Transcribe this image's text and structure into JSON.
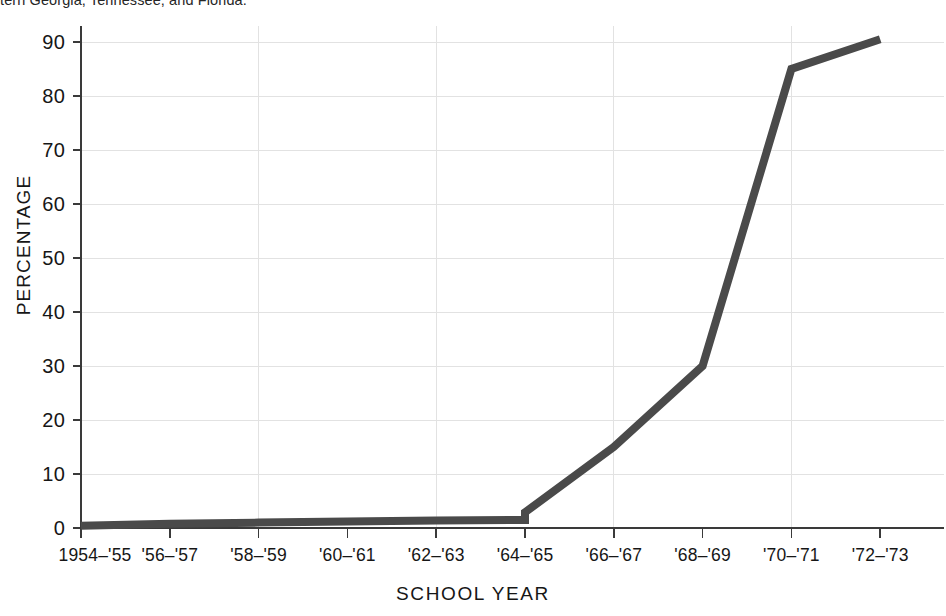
{
  "caption": {
    "text": "tern Georgia, Tennessee, and Florida."
  },
  "chart_data": {
    "type": "line",
    "title": "",
    "subtitle": "",
    "xlabel": "SCHOOL YEAR",
    "ylabel": "PERCENTAGE",
    "categories": [
      "1954–'55",
      "'56–'57",
      "'58–'59",
      "'60–'61",
      "'62–'63",
      "'64–'65",
      "'66–'67",
      "'68–'69",
      "'70–'71",
      "'72–'73"
    ],
    "series": [
      {
        "name": "Percentage",
        "values": [
          0.4,
          0.8,
          1.0,
          1.2,
          1.4,
          2.9,
          15.0,
          30.0,
          85.0,
          90.5
        ],
        "color": "#4a4a4a"
      }
    ],
    "step_marker": {
      "at_category": "'64–'65",
      "from_value": 1.5,
      "to_value": 2.9
    },
    "ylim": [
      0,
      92
    ],
    "yticks": [
      0,
      10,
      20,
      30,
      40,
      50,
      60,
      70,
      80,
      90
    ],
    "ytick_labels": [
      "0",
      "10",
      "20",
      "30",
      "40",
      "50",
      "60",
      "70",
      "80",
      "90"
    ],
    "grid": {
      "horizontal": true,
      "vertical": true,
      "vertical_at": [
        "'58–'59",
        "'62–'63",
        "'66–'67",
        "'70–'71"
      ],
      "color": "#e2e2e2"
    },
    "legend": null,
    "legend_position": "none",
    "axis_color": "#3a3a3a",
    "line_width_px": 8
  }
}
